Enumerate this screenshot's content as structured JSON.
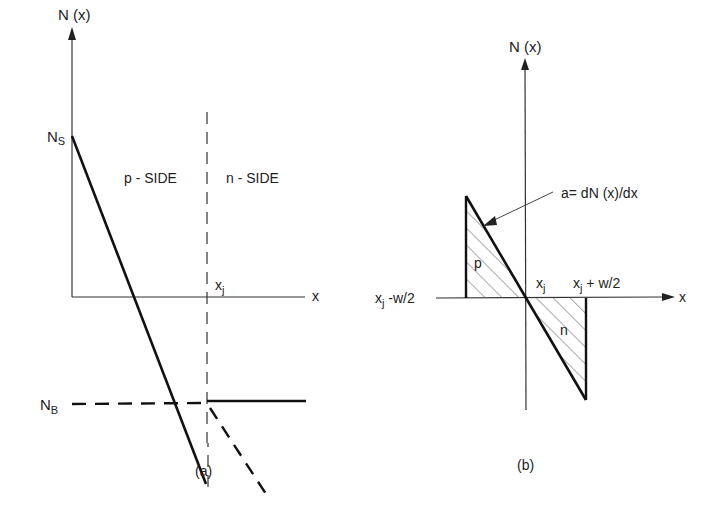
{
  "figure": {
    "panel_a": {
      "caption": "(a)",
      "y_axis_label": "N (x)",
      "x_axis_label": "x",
      "ns_label": "N",
      "ns_sub": "S",
      "nb_label": "N",
      "nb_sub": "B",
      "p_side_label": "p - SIDE",
      "n_side_label": "n - SIDE",
      "xj_label": "x",
      "xj_sub": "j"
    },
    "panel_b": {
      "caption": "(b)",
      "y_axis_label": "N (x)",
      "x_axis_label": "x",
      "annotation": "a= dN (x)/dx",
      "p_region_label": "p",
      "n_region_label": "n",
      "xj_label": "x",
      "xj_sub": "j",
      "left_bound_label": "x",
      "left_bound_sub": "j",
      "left_bound_suffix": " -w/2",
      "right_bound_label": "x",
      "right_bound_sub": "j",
      "right_bound_suffix": " + w/2"
    }
  }
}
